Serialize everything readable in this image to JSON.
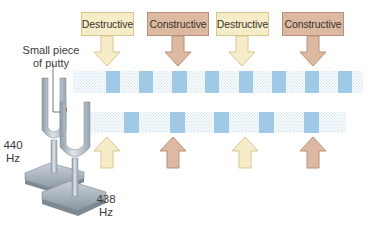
{
  "diagram": {
    "labels": [
      {
        "text": "Destructive",
        "type": "destructive",
        "x": 81,
        "w": 53,
        "cx": 107
      },
      {
        "text": "Constructive",
        "type": "constructive",
        "x": 147,
        "w": 62,
        "cx": 178
      },
      {
        "text": "Destructive",
        "type": "destructive",
        "x": 216,
        "w": 53,
        "cx": 242
      },
      {
        "text": "Constructive",
        "type": "constructive",
        "x": 282,
        "w": 62,
        "cx": 313
      }
    ],
    "up_arrows": [
      {
        "type": "destructive",
        "cx": 107
      },
      {
        "type": "constructive",
        "cx": 173
      },
      {
        "type": "destructive",
        "cx": 245
      },
      {
        "type": "constructive",
        "cx": 313
      }
    ],
    "annotations": {
      "putty_line1": "Small piece",
      "putty_line2": "of putty",
      "fork1_freq": "440",
      "fork1_unit": "Hz",
      "fork2_freq": "438",
      "fork2_unit": "Hz"
    },
    "waves": {
      "top": {
        "x": 73,
        "y": 71,
        "w": 290,
        "h": 22,
        "compressions": [
          113,
          147,
          180,
          212,
          246,
          279,
          312,
          345
        ]
      },
      "bottom": {
        "x": 90,
        "y": 112,
        "w": 256,
        "h": 21,
        "compressions": [
          131,
          177,
          221,
          266,
          311
        ]
      }
    },
    "colors": {
      "destructive_fill": "#f6ecc8",
      "destructive_stroke": "#d8c690",
      "constructive_fill": "#dcb9a0",
      "constructive_stroke": "#b8917a",
      "wave_light": "#bcd7ec",
      "wave_dark": "#8ec3e6",
      "fork_metal": "#b9c3cc",
      "putty": "#c0282e"
    }
  }
}
